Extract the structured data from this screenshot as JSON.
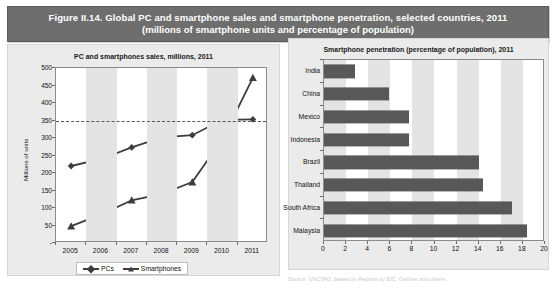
{
  "figure": {
    "title_line1": "Figure II.14. Global PC and smartphone sales and smartphone penetration, selected countries, 2011",
    "title_line2": "(millions of smartphone units and percentage of population)",
    "header_bg": "#6e6e6e",
    "header_text_color": "#ffffff"
  },
  "left_panel": {
    "title": "PC and smartphones sales, millions, 2011",
    "y_axis_title": "Millions of units",
    "legend": [
      {
        "label": "PCs",
        "marker": "diamond"
      },
      {
        "label": "Smartphones",
        "marker": "triangle"
      }
    ]
  },
  "right_panel": {
    "title": "Smartphone penetration (percentage of population), 2011"
  },
  "bottom_note": "Source: UNCTAD, based on Reports by IDC, Gartner and others.",
  "colors": {
    "series_line": "#3d3d3d",
    "bar_fill": "#585858",
    "band": "#e4e4e4",
    "panel_bg": "#ebebeb",
    "plot_bg": "#ffffff",
    "axis": "#8c8c8c",
    "target_line": "#555555"
  },
  "chart_data": [
    {
      "type": "line",
      "title": "PC and smartphones sales, millions, 2011",
      "xlabel": "",
      "ylabel": "Millions of units",
      "categories": [
        "2005",
        "2006",
        "2007",
        "2008",
        "2009",
        "2010",
        "2011"
      ],
      "ylim": [
        0,
        500
      ],
      "ytick_labels": [
        "-",
        "50",
        "100",
        "150",
        "200",
        "250",
        "300",
        "350",
        "400",
        "450",
        "500"
      ],
      "ytick_values": [
        0,
        50,
        100,
        150,
        200,
        250,
        300,
        350,
        400,
        450,
        500
      ],
      "grid": false,
      "legend_position": "bottom",
      "annotations": [
        {
          "kind": "hline",
          "value": 350,
          "style": "dashed",
          "label": ""
        }
      ],
      "series": [
        {
          "name": "PCs",
          "marker": "diamond",
          "values": [
            220,
            240,
            273,
            302,
            308,
            352,
            353
          ]
        },
        {
          "name": "Smartphones",
          "marker": "triangle",
          "values": [
            48,
            82,
            122,
            140,
            174,
            297,
            472
          ]
        }
      ]
    },
    {
      "type": "bar",
      "orientation": "horizontal",
      "title": "Smartphone penetration (percentage of population), 2011",
      "xlabel": "",
      "ylabel": "",
      "categories": [
        "India",
        "China",
        "Mexico",
        "Indonesia",
        "Brazil",
        "Thailand",
        "South Africa",
        "Malaysia"
      ],
      "values": [
        2.8,
        5.9,
        7.7,
        7.7,
        14.0,
        14.4,
        17.0,
        18.4
      ],
      "xlim": [
        0,
        20
      ],
      "xtick_labels": [
        "0",
        "2",
        "4",
        "6",
        "8",
        "10",
        "12",
        "14",
        "16",
        "18",
        "20"
      ],
      "xtick_values": [
        0,
        2,
        4,
        6,
        8,
        10,
        12,
        14,
        16,
        18,
        20
      ],
      "grid": false,
      "legend_position": "none"
    }
  ]
}
